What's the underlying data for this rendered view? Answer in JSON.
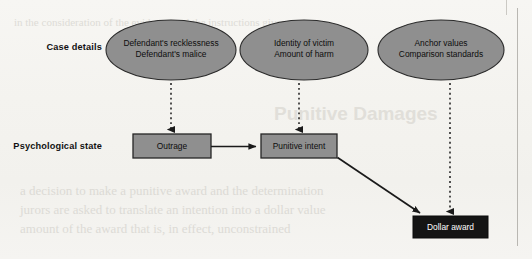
{
  "figure": {
    "rows": [
      {
        "id": "case-details",
        "label": "Case details"
      },
      {
        "id": "psychological-state",
        "label": "Psychological state"
      }
    ],
    "ellipses": [
      {
        "id": "defendant-conduct",
        "line1": "Defendant's recklessness",
        "line2": "Defendant's malice",
        "cx": 171,
        "cy": 50,
        "rx": 65,
        "ry": 30
      },
      {
        "id": "victim-harm",
        "line1": "Identity of victim",
        "line2": "Amount of harm",
        "cx": 304,
        "cy": 50,
        "rx": 64,
        "ry": 30
      },
      {
        "id": "anchors",
        "line1": "Anchor values",
        "line2": "Comparison standards",
        "cx": 441,
        "cy": 50,
        "rx": 63,
        "ry": 30
      }
    ],
    "boxes": [
      {
        "id": "outrage",
        "label": "Outrage",
        "x": 133,
        "y": 134,
        "w": 78,
        "h": 24,
        "style": "gray"
      },
      {
        "id": "punitive-intent",
        "label": "Punitive intent",
        "x": 261,
        "y": 134,
        "w": 76,
        "h": 24,
        "style": "gray"
      },
      {
        "id": "dollar-award",
        "label": "Dollar award",
        "x": 413,
        "y": 216,
        "w": 75,
        "h": 22,
        "style": "black"
      }
    ],
    "arrows": [
      {
        "id": "defendant-conduct-to-outrage",
        "kind": "dashed",
        "from": "defendant-conduct",
        "to": "outrage"
      },
      {
        "id": "victim-harm-to-punitive-intent",
        "kind": "dashed",
        "from": "victim-harm",
        "to": "punitive-intent"
      },
      {
        "id": "anchors-to-dollar-award",
        "kind": "dashed",
        "from": "anchors",
        "to": "dollar-award"
      },
      {
        "id": "outrage-to-punitive-intent",
        "kind": "solid",
        "from": "outrage",
        "to": "punitive-intent"
      },
      {
        "id": "punitive-intent-to-dollar-award",
        "kind": "solid",
        "from": "punitive-intent",
        "to": "dollar-award"
      }
    ],
    "colors": {
      "node_fill": "#8f8f8f",
      "node_stroke": "#2b2b2b",
      "award_fill": "#141414",
      "award_text": "#ffffff",
      "line": "#1a1a1a",
      "page": "#f5f4f1"
    }
  },
  "bleed_through": {
    "heading": "Punitive Damages",
    "lines": [
      "a decision to make a punitive award and the determination",
      "jurors are asked to translate an intention into a dollar value",
      "amount of the award that is, in effect, unconstrained"
    ],
    "upper": "in the consideration of the evidence and the instructions given"
  }
}
